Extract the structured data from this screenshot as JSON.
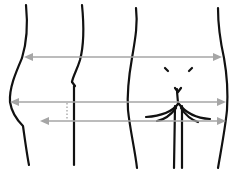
{
  "diagram": {
    "type": "body-measurement-diagram",
    "views": [
      {
        "name": "side-view",
        "description": "Side profile of hips/buttocks"
      },
      {
        "name": "back-view",
        "description": "Rear view of hips/buttocks with waist markers"
      }
    ],
    "measurements": [
      {
        "name": "waist",
        "y": 57,
        "x_start": 24,
        "x_end": 222,
        "style": "double-arrow"
      },
      {
        "name": "hip",
        "y": 102,
        "x_start": 10,
        "x_end": 226,
        "style": "double-arrow"
      },
      {
        "name": "low-hip",
        "y": 121,
        "x_start": 40,
        "x_end": 226,
        "style": "double-arrow"
      }
    ],
    "colors": {
      "outline": "#111111",
      "arrows": "#a6a6a6",
      "background": "#ffffff"
    }
  }
}
